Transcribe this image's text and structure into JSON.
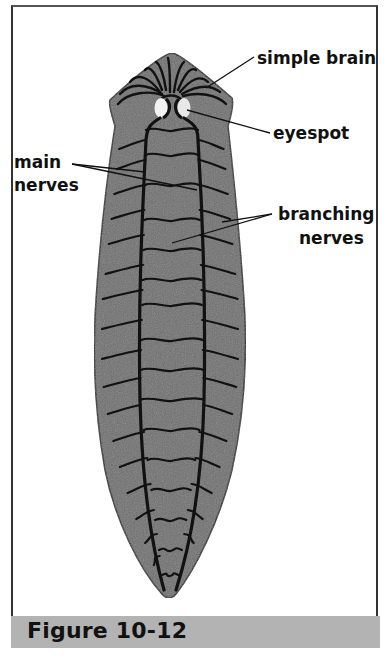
{
  "figure": {
    "caption": "Figure 10-12",
    "colors": {
      "body_fill": "#6f6f6f",
      "nerve": "#111111",
      "eyespot": "#f2f2f2",
      "caption_band": "#b3b3b3",
      "label_text": "#111111"
    }
  },
  "labels": {
    "simple_brain": "simple brain",
    "eyespot": "eyespot",
    "main_nerves_line1": "main",
    "main_nerves_line2": "nerves",
    "branching_nerves_line1": "branching",
    "branching_nerves_line2": "nerves"
  }
}
